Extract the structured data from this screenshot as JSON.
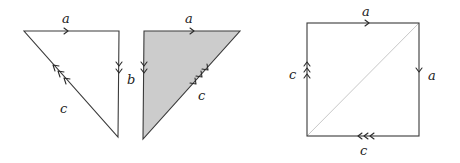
{
  "figures": [
    {
      "id": "triangle-left",
      "type": "triangle",
      "filled": false,
      "edges": [
        {
          "label": "a",
          "arrow_count": 1,
          "direction": "right"
        },
        {
          "label": "b",
          "arrow_count": 2,
          "direction": "down"
        },
        {
          "label": "c",
          "arrow_count": 3,
          "direction": "up-left"
        }
      ]
    },
    {
      "id": "triangle-middle",
      "type": "triangle",
      "filled": true,
      "fill_color": "#cccccc",
      "edges": [
        {
          "label": "a",
          "arrow_count": 1,
          "direction": "right"
        },
        {
          "label": "b",
          "arrow_count": 2,
          "direction": "down"
        },
        {
          "label": "c",
          "arrow_count": 3,
          "direction": "down-left"
        }
      ]
    },
    {
      "id": "square-right",
      "type": "square",
      "filled": false,
      "diagonal": true,
      "edges": [
        {
          "label": "a",
          "arrow_count": 1,
          "direction": "right"
        },
        {
          "label": "a",
          "arrow_count": 1,
          "direction": "down"
        },
        {
          "label": "c",
          "arrow_count": 3,
          "direction": "left"
        },
        {
          "label": "c",
          "arrow_count": 3,
          "direction": "up"
        }
      ]
    }
  ],
  "labels": {
    "t1_a": "a",
    "t1_b": "b",
    "t1_c": "c",
    "t2_a": "a",
    "t2_c": "c",
    "sq_top": "a",
    "sq_right": "a",
    "sq_bottom": "c",
    "sq_left": "c"
  },
  "colors": {
    "stroke": "#3a3a3a",
    "fill": "#cccccc",
    "diagonal": "#c8c8c8"
  }
}
